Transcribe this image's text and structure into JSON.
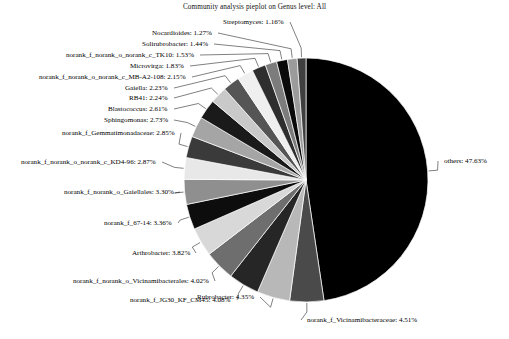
{
  "chart_data": {
    "type": "pie",
    "title": "Community analysis pieplot on Genus level:  All",
    "xlabel": "",
    "ylabel": "",
    "legend_position": "none",
    "grid": false,
    "value_unit": "%",
    "categories": [
      "others",
      "norank_f_Vicinamibacteraceae",
      "Rubrobacter",
      "norank_f_JG30_KF_CM45",
      "norank_f_norank_o_Vicinamibacterales",
      "Arthrobacter",
      "norank_f_67-14",
      "norank_f_norank_o_Gaiellales",
      "norank_f_norank_o_norank_c_KD4-96",
      "norank_f_Gemmatimonadaceae",
      "Sphingomonas",
      "Blastococcus",
      "RB41",
      "Gaiella",
      "norank_f_norank_o_norank_c_MB-A2-108",
      "Microvirga",
      "norank_f_norank_o_norank_c_TK10",
      "Solirubrobacter",
      "Nocardioides",
      "Streptomyces"
    ],
    "values": [
      47.63,
      4.51,
      4.35,
      4.08,
      4.02,
      3.82,
      3.36,
      3.3,
      2.87,
      2.85,
      2.73,
      2.61,
      2.24,
      2.23,
      2.15,
      1.83,
      1.53,
      1.44,
      1.27,
      1.16
    ],
    "colors": [
      "#000000",
      "#4a4a4a",
      "#b8b8b8",
      "#262626",
      "#6e6e6e",
      "#d8d8d8",
      "#0d0d0d",
      "#8f8f8f",
      "#e8e8e8",
      "#3a3a3a",
      "#a5a5a5",
      "#1a1a1a",
      "#c9c9c9",
      "#555555",
      "#efefef",
      "#2e2e2e",
      "#7c7c7c",
      "#0a0a0a",
      "#9b9b9b",
      "#3f3f3f"
    ],
    "slices": [
      {
        "label": "others",
        "value": 47.63,
        "text": "others:  47.63%",
        "color": "#000000"
      },
      {
        "label": "norank_f_Vicinamibacteraceae",
        "value": 4.51,
        "text": "norank_f_Vicinamibacteraceae:  4.51%",
        "color": "#4a4a4a"
      },
      {
        "label": "Rubrobacter",
        "value": 4.35,
        "text": "Rubrobacter:  4.35%",
        "color": "#b8b8b8"
      },
      {
        "label": "norank_f_JG30_KF_CM45",
        "value": 4.08,
        "text": "norank_f_JG30_KF_CM45:  4.08%",
        "color": "#262626"
      },
      {
        "label": "norank_f_norank_o_Vicinamibacterales",
        "value": 4.02,
        "text": "norank_f_norank_o_Vicinamibacterales:  4.02%",
        "color": "#6e6e6e"
      },
      {
        "label": "Arthrobacter",
        "value": 3.82,
        "text": "Arthrobacter:  3.82%",
        "color": "#d8d8d8"
      },
      {
        "label": "norank_f_67-14",
        "value": 3.36,
        "text": "norank_f_67-14:  3.36%",
        "color": "#0d0d0d"
      },
      {
        "label": "norank_f_norank_o_Gaiellales",
        "value": 3.3,
        "text": "norank_f_norank_o_Gaiellales:  3.30%",
        "color": "#8f8f8f"
      },
      {
        "label": "norank_f_norank_o_norank_c_KD4-96",
        "value": 2.87,
        "text": "norank_f_norank_o_norank_c_KD4-96:  2.87%",
        "color": "#e8e8e8"
      },
      {
        "label": "norank_f_Gemmatimonadaceae",
        "value": 2.85,
        "text": "norank_f_Gemmatimonadaceae:  2.85%",
        "color": "#3a3a3a"
      },
      {
        "label": "Sphingomonas",
        "value": 2.73,
        "text": "Sphingomonas:  2.73%",
        "color": "#a5a5a5"
      },
      {
        "label": "Blastococcus",
        "value": 2.61,
        "text": "Blastococcus:  2.61%",
        "color": "#1a1a1a"
      },
      {
        "label": "RB41",
        "value": 2.24,
        "text": "RB41:  2.24%",
        "color": "#c9c9c9"
      },
      {
        "label": "Gaiella",
        "value": 2.23,
        "text": "Gaiella:  2.23%",
        "color": "#555555"
      },
      {
        "label": "norank_f_norank_o_norank_c_MB-A2-108",
        "value": 2.15,
        "text": "norank_f_norank_o_norank_c_MB-A2-108:  2.15%",
        "color": "#efefef"
      },
      {
        "label": "Microvirga",
        "value": 1.83,
        "text": "Microvirga:  1.83%",
        "color": "#2e2e2e"
      },
      {
        "label": "norank_f_norank_o_norank_c_TK10",
        "value": 1.53,
        "text": "norank_f_norank_o_norank_c_TK10:  1.53%",
        "color": "#7c7c7c"
      },
      {
        "label": "Solirubrobacter",
        "value": 1.44,
        "text": "Solirubrobacter:  1.44%",
        "color": "#0a0a0a"
      },
      {
        "label": "Nocardioides",
        "value": 1.27,
        "text": "Nocardioides:  1.27%",
        "color": "#9b9b9b"
      },
      {
        "label": "Streptomyces",
        "value": 1.16,
        "text": "Streptomyces:  1.16%",
        "color": "#3f3f3f"
      }
    ]
  },
  "geometry": {
    "center_x": 306,
    "center_y": 180,
    "radius": 122,
    "start_angle_deg": -90
  }
}
